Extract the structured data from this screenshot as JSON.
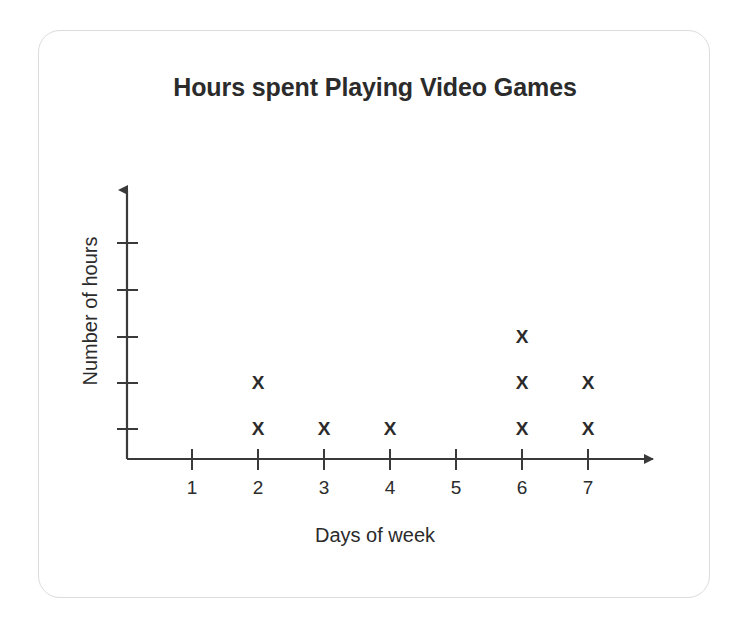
{
  "card": {
    "background_color": "#ffffff",
    "border_color": "#dcdcdc"
  },
  "chart": {
    "title": "Hours spent Playing Video Games",
    "x_axis_label": "Days of week",
    "y_axis_label": "Number of hours",
    "mark_glyph": "X",
    "mark_color": "#2b2b2b",
    "axis_color": "#3a3a3a"
  },
  "chart_data": {
    "type": "scatter",
    "plot_style": "dot-plot",
    "title": "Hours spent Playing Video Games",
    "xlabel": "Days of week",
    "ylabel": "Number of hours",
    "categories": [
      "1",
      "2",
      "3",
      "4",
      "5",
      "6",
      "7"
    ],
    "x": [
      1,
      2,
      3,
      4,
      5,
      6,
      7
    ],
    "values": [
      0,
      2,
      1,
      1,
      0,
      3,
      2
    ],
    "marks": [
      {
        "day": 1,
        "count": 0,
        "levels": []
      },
      {
        "day": 2,
        "count": 2,
        "levels": [
          1,
          2
        ]
      },
      {
        "day": 3,
        "count": 1,
        "levels": [
          1
        ]
      },
      {
        "day": 4,
        "count": 1,
        "levels": [
          1
        ]
      },
      {
        "day": 5,
        "count": 0,
        "levels": []
      },
      {
        "day": 6,
        "count": 3,
        "levels": [
          1,
          2,
          3
        ]
      },
      {
        "day": 7,
        "count": 2,
        "levels": [
          1,
          2
        ]
      }
    ],
    "xlim": [
      0.5,
      7.6
    ],
    "ylim": [
      0,
      5
    ],
    "y_tick_count": 5,
    "y_tick_labels": [],
    "x_tick_labels": [
      "1",
      "2",
      "3",
      "4",
      "5",
      "6",
      "7"
    ],
    "grid": false,
    "legend": null
  },
  "geometry": {
    "y_axis_x": 127,
    "x_axis_y": 459,
    "y_axis_tip": 180,
    "x_axis_tip": 663,
    "x_tick_positions": [
      192,
      258,
      324,
      390,
      456,
      522,
      588
    ],
    "y_tick_positions": [
      429,
      383,
      337,
      290,
      243
    ]
  }
}
